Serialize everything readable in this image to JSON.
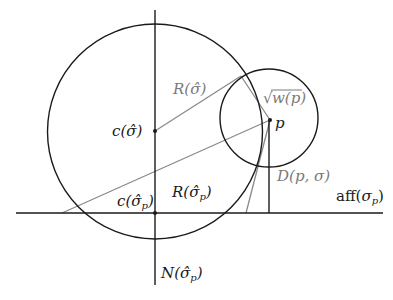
{
  "colors": {
    "dark_stroke": "#1a1a1a",
    "gray_stroke": "#8a8a8a",
    "background": "#ffffff"
  },
  "labels": {
    "c_sigma_hat": {
      "main": "c(",
      "sym": "σ̂",
      "close": ")"
    },
    "R_sigma_hat": {
      "main": "R(",
      "sym": "σ̂",
      "close": ")"
    },
    "sqrt_w_p": {
      "radical": "√",
      "body": "w(p)"
    },
    "p": "p",
    "c_sigma_hat_p": {
      "main": "c(",
      "sym": "σ̂",
      "sub": "p",
      "close": ")"
    },
    "R_sigma_hat_p": {
      "main": "R(",
      "sym": "σ̂",
      "sub": "p",
      "close": ")"
    },
    "D_p_sigma": "D(p, σ)",
    "aff_sigma_p": {
      "main": "aff(",
      "sym": "σ",
      "sub": "p",
      "close": ")"
    },
    "N_sigma_hat_p": {
      "main": "N(",
      "sym": "σ̂",
      "sub": "p",
      "close": ")"
    }
  },
  "geometry": {
    "big_circle": {
      "cx": 155,
      "cy": 131.5,
      "r": 107.5
    },
    "small_circle": {
      "cx": 269,
      "cy": 118,
      "r": 49
    },
    "vertical_axis": {
      "x": 155,
      "y1": 10,
      "y2": 285
    },
    "horizontal_line": {
      "y": 213,
      "x1": 16,
      "x2": 383
    },
    "point_c_sigma_hat": {
      "x": 155,
      "y": 131
    },
    "point_c_sigma_hat_p": {
      "x": 155,
      "y": 213
    },
    "point_p": {
      "x": 270,
      "y": 120
    },
    "circle_intersection": {
      "x": 241,
      "y": 76
    }
  }
}
